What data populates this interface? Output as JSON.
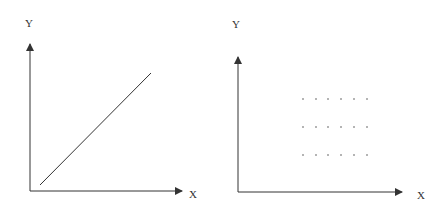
{
  "colors": {
    "ink": "#333333",
    "dot": "#555555",
    "background": "#ffffff"
  },
  "left_panel": {
    "y_label": "Y",
    "x_label": "X",
    "line": {
      "x1": 40,
      "y1": 185,
      "x2": 151,
      "y2": 73
    }
  },
  "right_panel": {
    "y_label": "Y",
    "x_label": "X",
    "dot_columns": [
      303,
      316,
      328,
      341,
      354,
      367
    ],
    "dot_rows": [
      99,
      127,
      155
    ]
  }
}
